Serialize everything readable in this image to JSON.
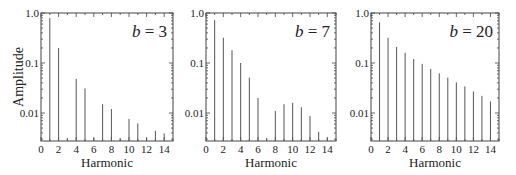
{
  "figure": {
    "ylabel": "Amplitude",
    "xlabel": "Harmonic",
    "y_ticks": [
      "1.0",
      "0.1",
      "0.01"
    ],
    "x_ticks": [
      "0",
      "2",
      "4",
      "6",
      "8",
      "10",
      "12",
      "14"
    ],
    "colors": {
      "axis": "#444444",
      "bar": "#555555",
      "text": "#222222"
    }
  },
  "chart_data": [
    {
      "type": "bar",
      "title": "b = 3",
      "annotation": {
        "var": "b",
        "value": "3"
      },
      "xlabel": "Harmonic",
      "ylabel": "Amplitude",
      "yscale": "log",
      "xlim": [
        0,
        15
      ],
      "ylim": [
        0.0027,
        1.0
      ],
      "x": [
        1,
        2,
        3,
        4,
        5,
        6,
        7,
        8,
        9,
        10,
        11,
        12,
        13,
        14
      ],
      "values": [
        0.79,
        0.2,
        0,
        0.048,
        0.031,
        0,
        0.015,
        0.012,
        0,
        0.0076,
        0.0062,
        0,
        0.0044,
        0.0039
      ]
    },
    {
      "type": "bar",
      "title": "b = 7",
      "annotation": {
        "var": "b",
        "value": "7"
      },
      "xlabel": "Harmonic",
      "ylabel": "",
      "yscale": "log",
      "xlim": [
        0,
        15
      ],
      "ylim": [
        0.0027,
        1.0
      ],
      "x": [
        1,
        2,
        3,
        4,
        5,
        6,
        7,
        8,
        9,
        10,
        11,
        12,
        13,
        14
      ],
      "values": [
        0.72,
        0.32,
        0.18,
        0.1,
        0.051,
        0.02,
        0,
        0.011,
        0.015,
        0.016,
        0.013,
        0.0087,
        0.0042,
        0
      ]
    },
    {
      "type": "bar",
      "title": "b = 20",
      "annotation": {
        "var": "b",
        "value": "20"
      },
      "xlabel": "Harmonic",
      "ylabel": "",
      "yscale": "log",
      "xlim": [
        0,
        15
      ],
      "ylim": [
        0.0027,
        1.0
      ],
      "x": [
        1,
        2,
        3,
        4,
        5,
        6,
        7,
        8,
        9,
        10,
        11,
        12,
        13,
        14
      ],
      "values": [
        0.65,
        0.32,
        0.21,
        0.16,
        0.12,
        0.096,
        0.076,
        0.062,
        0.051,
        0.041,
        0.034,
        0.027,
        0.022,
        0.017
      ]
    }
  ]
}
